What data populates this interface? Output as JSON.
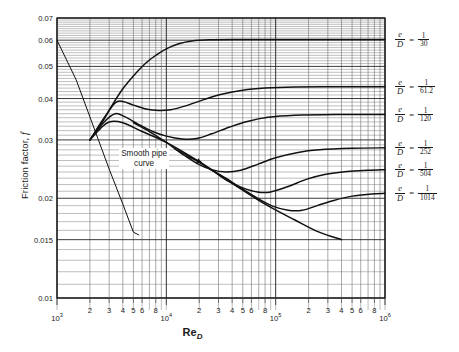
{
  "figure": {
    "title": "",
    "y_axis_title": "Friction factor, f",
    "y_axis_title_main": "Friction factor,",
    "y_axis_title_symbol": "f",
    "x_axis_title": "Re",
    "x_axis_title_sub": "D",
    "smooth_note_line1": "Smooth pipe",
    "smooth_note_line2": "curve",
    "ed_prefix_num": "e",
    "ed_prefix_den": "D",
    "equals": "="
  },
  "chart_data": {
    "type": "line",
    "xlabel": "Re_D",
    "ylabel": "Friction factor, f",
    "xscale": "log",
    "yscale": "log",
    "xlim": [
      1000,
      1000000
    ],
    "ylim": [
      0.01,
      0.07
    ],
    "grid": true,
    "legend_position": "right-outside",
    "xticks": [
      {
        "value": 1000,
        "label": "10",
        "exp": "3",
        "major": true
      },
      {
        "value": 2000,
        "label": "2",
        "exp": "",
        "major": false
      },
      {
        "value": 3000,
        "label": "3",
        "exp": "",
        "major": false
      },
      {
        "value": 4000,
        "label": "4",
        "exp": "",
        "major": false
      },
      {
        "value": 5000,
        "label": "5",
        "exp": "",
        "major": false
      },
      {
        "value": 6000,
        "label": "6",
        "exp": "",
        "major": false
      },
      {
        "value": 8000,
        "label": "8",
        "exp": "",
        "major": false
      },
      {
        "value": 10000,
        "label": "10",
        "exp": "4",
        "major": true
      },
      {
        "value": 20000,
        "label": "2",
        "exp": "",
        "major": false
      },
      {
        "value": 30000,
        "label": "3",
        "exp": "",
        "major": false
      },
      {
        "value": 40000,
        "label": "4",
        "exp": "",
        "major": false
      },
      {
        "value": 50000,
        "label": "5",
        "exp": "",
        "major": false
      },
      {
        "value": 60000,
        "label": "6",
        "exp": "",
        "major": false
      },
      {
        "value": 80000,
        "label": "8",
        "exp": "",
        "major": false
      },
      {
        "value": 100000,
        "label": "10",
        "exp": "5",
        "major": true
      },
      {
        "value": 200000,
        "label": "2",
        "exp": "",
        "major": false
      },
      {
        "value": 300000,
        "label": "3",
        "exp": "",
        "major": false
      },
      {
        "value": 400000,
        "label": "4",
        "exp": "",
        "major": false
      },
      {
        "value": 500000,
        "label": "5",
        "exp": "",
        "major": false
      },
      {
        "value": 600000,
        "label": "6",
        "exp": "",
        "major": false
      },
      {
        "value": 800000,
        "label": "8",
        "exp": "",
        "major": false
      },
      {
        "value": 1000000,
        "label": "10",
        "exp": "6",
        "major": true
      }
    ],
    "yticks": [
      {
        "value": 0.07,
        "label": "0.07"
      },
      {
        "value": 0.06,
        "label": "0.06"
      },
      {
        "value": 0.05,
        "label": "0.05"
      },
      {
        "value": 0.04,
        "label": "0.04"
      },
      {
        "value": 0.03,
        "label": "0.03"
      },
      {
        "value": 0.02,
        "label": "0.02"
      },
      {
        "value": 0.015,
        "label": "0.015"
      },
      {
        "value": 0.01,
        "label": "0.01"
      }
    ],
    "annotations": [
      {
        "name": "smooth-pipe-curve",
        "text": "Smooth pipe curve",
        "x": 4200,
        "y": 0.0262,
        "arrow_to_x": 22000,
        "arrow_to_y": 0.0258
      }
    ],
    "series": [
      {
        "name": "laminar-line",
        "label": "Laminar (f = 64/Re)",
        "style": "straight",
        "points": [
          [
            1000,
            0.06
          ],
          [
            1500,
            0.0455
          ],
          [
            2000,
            0.0352
          ],
          [
            3000,
            0.0245
          ],
          [
            4000,
            0.0192
          ],
          [
            5000,
            0.0158
          ],
          [
            5600,
            0.0155
          ]
        ]
      },
      {
        "name": "smooth-pipe-curve",
        "label": "Smooth pipe curve",
        "style": "curve",
        "points": [
          [
            2000,
            0.03
          ],
          [
            2500,
            0.0325
          ],
          [
            3000,
            0.034
          ],
          [
            4000,
            0.0338
          ],
          [
            6000,
            0.0318
          ],
          [
            10000,
            0.0295
          ],
          [
            20000,
            0.0258
          ],
          [
            40000,
            0.0222
          ],
          [
            80000,
            0.0192
          ],
          [
            150000,
            0.0172
          ],
          [
            250000,
            0.0158
          ],
          [
            400000,
            0.015
          ]
        ]
      },
      {
        "name": "ed-1-30",
        "label": "e/D = 1/30",
        "ed_value": 0.03333,
        "points": [
          [
            2000,
            0.03
          ],
          [
            2600,
            0.034
          ],
          [
            3200,
            0.0382
          ],
          [
            4000,
            0.0428
          ],
          [
            5000,
            0.0468
          ],
          [
            6500,
            0.0512
          ],
          [
            8000,
            0.054
          ],
          [
            10000,
            0.0565
          ],
          [
            13000,
            0.0585
          ],
          [
            17000,
            0.0597
          ],
          [
            25000,
            0.0602
          ],
          [
            50000,
            0.0603
          ],
          [
            200000,
            0.0603
          ],
          [
            1000000,
            0.0603
          ]
        ]
      },
      {
        "name": "ed-1-61-2",
        "label": "e/D = 1/61.2",
        "ed_value": 0.01634,
        "points": [
          [
            2000,
            0.03
          ],
          [
            2700,
            0.035
          ],
          [
            3400,
            0.0388
          ],
          [
            4000,
            0.0392
          ],
          [
            5000,
            0.0382
          ],
          [
            6500,
            0.0372
          ],
          [
            8500,
            0.0368
          ],
          [
            11000,
            0.037
          ],
          [
            15000,
            0.038
          ],
          [
            22000,
            0.0397
          ],
          [
            32000,
            0.0412
          ],
          [
            50000,
            0.0424
          ],
          [
            80000,
            0.043
          ],
          [
            150000,
            0.0433
          ],
          [
            400000,
            0.0434
          ],
          [
            1000000,
            0.0434
          ]
        ]
      },
      {
        "name": "ed-1-120",
        "label": "e/D = 1/120",
        "ed_value": 0.008333,
        "points": [
          [
            2000,
            0.03
          ],
          [
            2700,
            0.034
          ],
          [
            3400,
            0.036
          ],
          [
            4200,
            0.0352
          ],
          [
            5500,
            0.0335
          ],
          [
            7500,
            0.0318
          ],
          [
            10000,
            0.0308
          ],
          [
            14000,
            0.0302
          ],
          [
            19000,
            0.0303
          ],
          [
            26000,
            0.0313
          ],
          [
            38000,
            0.0328
          ],
          [
            55000,
            0.0341
          ],
          [
            85000,
            0.0351
          ],
          [
            150000,
            0.0356
          ],
          [
            350000,
            0.0358
          ],
          [
            1000000,
            0.0358
          ]
        ]
      },
      {
        "name": "ed-1-252",
        "label": "e/D = 1/252",
        "ed_value": 0.003968,
        "points": [
          [
            5000,
            0.0338
          ],
          [
            7000,
            0.0318
          ],
          [
            10000,
            0.0295
          ],
          [
            14000,
            0.0272
          ],
          [
            19000,
            0.0255
          ],
          [
            26000,
            0.0244
          ],
          [
            35000,
            0.024
          ],
          [
            48000,
            0.0243
          ],
          [
            70000,
            0.0254
          ],
          [
            100000,
            0.0265
          ],
          [
            160000,
            0.0275
          ],
          [
            250000,
            0.028
          ],
          [
            500000,
            0.0283
          ],
          [
            1000000,
            0.0284
          ]
        ]
      },
      {
        "name": "ed-1-504",
        "label": "e/D = 1/504",
        "ed_value": 0.001984,
        "points": [
          [
            12000,
            0.0282
          ],
          [
            18000,
            0.0262
          ],
          [
            26000,
            0.0243
          ],
          [
            36000,
            0.0226
          ],
          [
            50000,
            0.0215
          ],
          [
            68000,
            0.0209
          ],
          [
            90000,
            0.0209
          ],
          [
            130000,
            0.0217
          ],
          [
            190000,
            0.0228
          ],
          [
            280000,
            0.0236
          ],
          [
            450000,
            0.0241
          ],
          [
            700000,
            0.0243
          ],
          [
            1000000,
            0.0244
          ]
        ]
      },
      {
        "name": "ed-1-1014",
        "label": "e/D = 1/1014",
        "ed_value": 0.000986,
        "points": [
          [
            25000,
            0.0245
          ],
          [
            35000,
            0.023
          ],
          [
            50000,
            0.0213
          ],
          [
            70000,
            0.0199
          ],
          [
            95000,
            0.0189
          ],
          [
            130000,
            0.0184
          ],
          [
            175000,
            0.0184
          ],
          [
            240000,
            0.019
          ],
          [
            340000,
            0.0197
          ],
          [
            500000,
            0.0203
          ],
          [
            750000,
            0.0206
          ],
          [
            1000000,
            0.0207
          ]
        ]
      }
    ]
  },
  "ed_labels": [
    {
      "name": "ed-label-1-30",
      "num": "1",
      "den": "30",
      "y": 0.0603
    },
    {
      "name": "ed-label-1-61-2",
      "num": "1",
      "den": "61.2",
      "y": 0.0434
    },
    {
      "name": "ed-label-1-120",
      "num": "1",
      "den": "120",
      "y": 0.0358
    },
    {
      "name": "ed-label-1-252",
      "num": "1",
      "den": "252",
      "y": 0.0284
    },
    {
      "name": "ed-label-1-504",
      "num": "1",
      "den": "504",
      "y": 0.0244
    },
    {
      "name": "ed-label-1-1014",
      "num": "1",
      "den": "1014",
      "y": 0.0207
    }
  ]
}
